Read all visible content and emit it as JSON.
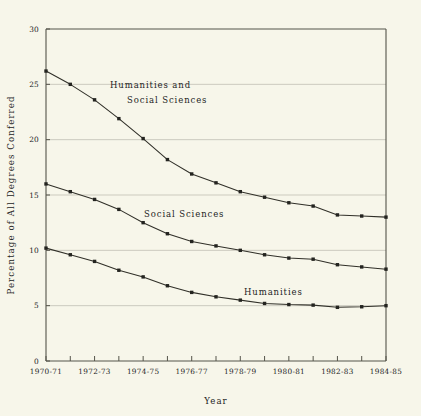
{
  "chart_data": {
    "type": "line",
    "title": "",
    "xlabel": "Year",
    "ylabel": "Percentage of All Degrees Conferred",
    "ylim": [
      0,
      30
    ],
    "yticks": [
      0,
      5,
      10,
      15,
      20,
      25,
      30
    ],
    "ytick_labels": [
      "0",
      "5",
      "10",
      "15",
      "20",
      "25",
      "30"
    ],
    "grid": "horizontal",
    "legend_position": "inline-annotations",
    "x": [
      "1970-71",
      "1971-72",
      "1972-73",
      "1973-74",
      "1974-75",
      "1975-76",
      "1976-77",
      "1977-78",
      "1978-79",
      "1979-80",
      "1980-81",
      "1981-82",
      "1982-83",
      "1983-84",
      "1984-85"
    ],
    "xtick_labels": [
      "1970-71",
      "1972-73",
      "1974-75",
      "1976-77",
      "1978-79",
      "1980-81",
      "1982-83",
      "1984-85"
    ],
    "xtick_indices": [
      0,
      2,
      4,
      6,
      8,
      10,
      12,
      14
    ],
    "series": [
      {
        "name": "Humanities and Social Sciences",
        "label_lines": [
          "Humanities and",
          "Social Sciences"
        ],
        "values": [
          26.2,
          25.0,
          23.6,
          21.9,
          20.1,
          18.2,
          16.9,
          16.1,
          15.3,
          14.8,
          14.3,
          14.0,
          13.2,
          13.1,
          13.0
        ]
      },
      {
        "name": "Social Sciences",
        "label_lines": [
          "Social Sciences"
        ],
        "values": [
          16.0,
          15.3,
          14.6,
          13.7,
          12.5,
          11.5,
          10.8,
          10.4,
          10.0,
          9.6,
          9.3,
          9.2,
          8.7,
          8.5,
          8.3
        ]
      },
      {
        "name": "Humanities",
        "label_lines": [
          "Humanities"
        ],
        "values": [
          10.2,
          9.6,
          9.0,
          8.2,
          7.6,
          6.8,
          6.2,
          5.8,
          5.5,
          5.2,
          5.1,
          5.05,
          4.85,
          4.9,
          5.0
        ]
      }
    ],
    "colors": {
      "background": "#f7f6ea",
      "line": "#302f28",
      "marker": "#242420",
      "axis": "#55544a",
      "grid": "#b9b8ad",
      "text": "#24241e"
    },
    "annotations": [
      {
        "text": "Humanities and",
        "series": "Humanities and Social Sciences"
      },
      {
        "text": "Social Sciences",
        "series": "Humanities and Social Sciences"
      },
      {
        "text": "Social Sciences",
        "series": "Social Sciences"
      },
      {
        "text": "Humanities",
        "series": "Humanities"
      }
    ]
  }
}
